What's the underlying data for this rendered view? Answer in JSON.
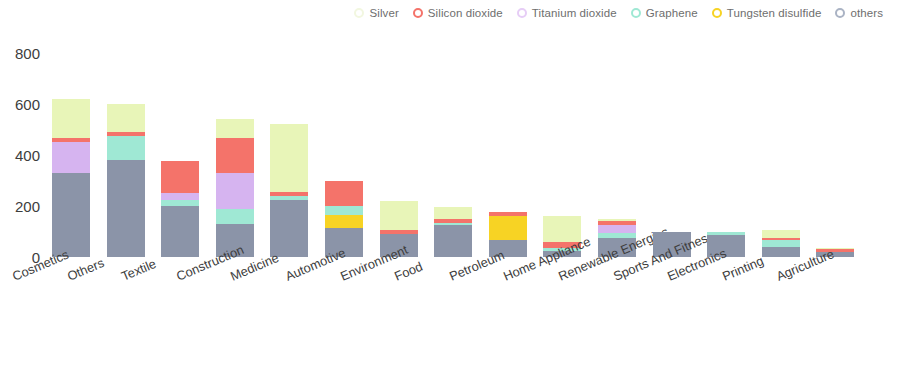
{
  "legend": {
    "position": "top-right",
    "items": [
      {
        "label": "Silver",
        "color": "#e8f5b8",
        "marker": "#f2f7e0"
      },
      {
        "label": "Silicon dioxide",
        "color": "#f4736a",
        "marker": "#f4736a"
      },
      {
        "label": "Titanium dioxide",
        "color": "#d6b4f0",
        "marker": "#e6cdf6"
      },
      {
        "label": "Graphene",
        "color": "#9fe8d4",
        "marker": "#9fe8d4"
      },
      {
        "label": "Tungsten disulfide",
        "color": "#f7d324",
        "marker": "#f7d324"
      },
      {
        "label": "others",
        "color": "#8b94a8",
        "marker": "#aab3c4"
      }
    ]
  },
  "y_axis": {
    "ticks": [
      "0",
      "200",
      "400",
      "600",
      "800"
    ],
    "min": 0,
    "max": 800
  },
  "chart_data": {
    "type": "bar",
    "stacked": true,
    "title": "",
    "subtitle": "",
    "xlabel": "",
    "ylabel": "",
    "ylim": [
      0,
      800
    ],
    "grid": false,
    "legend_position": "top-right",
    "categories": [
      "Cosmetics",
      "Others",
      "Textile",
      "Construction",
      "Medicine",
      "Automotive",
      "Environment",
      "Food",
      "Petroleum",
      "Home Appliance",
      "Renewable Energies",
      "Sports And Fitness",
      "Electronics",
      "Printing",
      "Agriculture"
    ],
    "series": [
      {
        "name": "others",
        "color": "#8b94a8",
        "values": [
          330,
          380,
          200,
          130,
          225,
          115,
          90,
          125,
          65,
          25,
          75,
          100,
          85,
          40,
          20
        ]
      },
      {
        "name": "Tungsten disulfide",
        "color": "#f7d324",
        "values": [
          0,
          0,
          0,
          0,
          0,
          50,
          0,
          0,
          95,
          0,
          0,
          0,
          0,
          0,
          0
        ]
      },
      {
        "name": "Graphene",
        "color": "#9fe8d4",
        "values": [
          0,
          95,
          25,
          60,
          15,
          35,
          0,
          10,
          0,
          10,
          20,
          0,
          15,
          25,
          0
        ]
      },
      {
        "name": "Titanium dioxide",
        "color": "#d6b4f0",
        "values": [
          120,
          0,
          25,
          140,
          0,
          0,
          0,
          0,
          0,
          0,
          30,
          0,
          0,
          0,
          0
        ]
      },
      {
        "name": "Silicon dioxide",
        "color": "#f4736a",
        "values": [
          15,
          15,
          125,
          135,
          15,
          100,
          15,
          15,
          15,
          25,
          15,
          0,
          0,
          10,
          10
        ]
      },
      {
        "name": "Silver",
        "color": "#e8f5b8",
        "values": [
          155,
          110,
          0,
          75,
          265,
          0,
          115,
          45,
          0,
          100,
          10,
          0,
          0,
          30,
          5
        ]
      }
    ],
    "totals": [
      620,
      600,
      375,
      540,
      520,
      300,
      220,
      195,
      175,
      160,
      150,
      100,
      100,
      105,
      35
    ]
  }
}
